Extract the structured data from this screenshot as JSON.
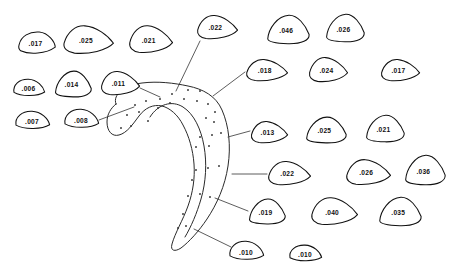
{
  "figure": {
    "title": "",
    "background_color": "#ffffff",
    "ink_color": "#111111",
    "main_shape_name": "hook-shaped-outline",
    "dot_count": 34
  },
  "blobs": [
    {
      "id": "blob-017-a",
      "label": ".017",
      "x": 18,
      "y": 30,
      "w": 38,
      "h": 26,
      "shape": "wedge-left",
      "leader": false
    },
    {
      "id": "blob-025-a",
      "label": ".025",
      "x": 62,
      "y": 24,
      "w": 52,
      "h": 31,
      "shape": "wedge-wide",
      "leader": false
    },
    {
      "id": "blob-021-a",
      "label": ".021",
      "x": 128,
      "y": 24,
      "w": 45,
      "h": 30,
      "shape": "wedge-wide",
      "leader": false
    },
    {
      "id": "blob-022-a",
      "label": ".022",
      "x": 196,
      "y": 14,
      "w": 42,
      "h": 26,
      "shape": "wedge-wide",
      "leader": true
    },
    {
      "id": "blob-046",
      "label": ".046",
      "x": 266,
      "y": 14,
      "w": 44,
      "h": 31,
      "shape": "triangle-round",
      "leader": false
    },
    {
      "id": "blob-026-a",
      "label": ".026",
      "x": 325,
      "y": 13,
      "w": 40,
      "h": 30,
      "shape": "triangle-round",
      "leader": false
    },
    {
      "id": "blob-006",
      "label": ".006",
      "x": 12,
      "y": 78,
      "w": 33,
      "h": 20,
      "shape": "small-oval",
      "leader": false
    },
    {
      "id": "blob-014",
      "label": ".014",
      "x": 54,
      "y": 70,
      "w": 38,
      "h": 28,
      "shape": "triangle-round",
      "leader": false
    },
    {
      "id": "blob-011",
      "label": ".011",
      "x": 100,
      "y": 70,
      "w": 40,
      "h": 26,
      "shape": "wedge-wide",
      "leader": true
    },
    {
      "id": "blob-018",
      "label": ".018",
      "x": 245,
      "y": 58,
      "w": 43,
      "h": 24,
      "shape": "wedge-wide",
      "leader": true
    },
    {
      "id": "blob-024",
      "label": ".024",
      "x": 308,
      "y": 56,
      "w": 40,
      "h": 27,
      "shape": "wedge-wide",
      "leader": false
    },
    {
      "id": "blob-017-b",
      "label": ".017",
      "x": 380,
      "y": 58,
      "w": 40,
      "h": 24,
      "shape": "wedge-wide",
      "leader": false
    },
    {
      "id": "blob-007",
      "label": ".007",
      "x": 14,
      "y": 110,
      "w": 36,
      "h": 21,
      "shape": "small-oval",
      "leader": false
    },
    {
      "id": "blob-008",
      "label": ".008",
      "x": 63,
      "y": 108,
      "w": 36,
      "h": 22,
      "shape": "small-oval",
      "leader": true
    },
    {
      "id": "blob-013",
      "label": ".013",
      "x": 250,
      "y": 120,
      "w": 38,
      "h": 24,
      "shape": "wedge-wide",
      "leader": true
    },
    {
      "id": "blob-025-b",
      "label": ".025",
      "x": 305,
      "y": 116,
      "w": 42,
      "h": 28,
      "shape": "triangle-round",
      "leader": false
    },
    {
      "id": "blob-021-b",
      "label": ".021",
      "x": 365,
      "y": 114,
      "w": 40,
      "h": 29,
      "shape": "triangle-round",
      "leader": false
    },
    {
      "id": "blob-022-b",
      "label": ".022",
      "x": 267,
      "y": 160,
      "w": 44,
      "h": 26,
      "shape": "wedge-wide",
      "leader": true
    },
    {
      "id": "blob-026-b",
      "label": ".026",
      "x": 345,
      "y": 158,
      "w": 46,
      "h": 28,
      "shape": "wedge-wide",
      "leader": false
    },
    {
      "id": "blob-036",
      "label": ".036",
      "x": 404,
      "y": 154,
      "w": 42,
      "h": 32,
      "shape": "triangle-round",
      "leader": false
    },
    {
      "id": "blob-019",
      "label": ".019",
      "x": 248,
      "y": 198,
      "w": 38,
      "h": 27,
      "shape": "triangle-round",
      "leader": true
    },
    {
      "id": "blob-040",
      "label": ".040",
      "x": 310,
      "y": 196,
      "w": 48,
      "h": 30,
      "shape": "wedge-wide",
      "leader": false
    },
    {
      "id": "blob-035",
      "label": ".035",
      "x": 378,
      "y": 196,
      "w": 44,
      "h": 31,
      "shape": "triangle-round",
      "leader": false
    },
    {
      "id": "blob-010-a",
      "label": ".010",
      "x": 228,
      "y": 240,
      "w": 36,
      "h": 22,
      "shape": "small-oval",
      "leader": true
    },
    {
      "id": "blob-010-b",
      "label": ".010",
      "x": 288,
      "y": 244,
      "w": 34,
      "h": 19,
      "shape": "small-oval",
      "leader": false
    }
  ],
  "leader_lines": [
    {
      "id": "leader-022-a",
      "from_blob": "blob-022-a",
      "x1": 200,
      "y1": 41,
      "x2": 176,
      "y2": 91
    },
    {
      "id": "leader-011",
      "from_blob": "blob-011",
      "x1": 140,
      "y1": 88,
      "x2": 160,
      "y2": 97
    },
    {
      "id": "leader-018",
      "from_blob": "blob-018",
      "x1": 245,
      "y1": 72,
      "x2": 213,
      "y2": 96
    },
    {
      "id": "leader-008",
      "from_blob": "blob-008",
      "x1": 99,
      "y1": 120,
      "x2": 134,
      "y2": 107
    },
    {
      "id": "leader-013",
      "from_blob": "blob-013",
      "x1": 250,
      "y1": 131,
      "x2": 228,
      "y2": 137
    },
    {
      "id": "leader-022-b",
      "from_blob": "blob-022-b",
      "x1": 267,
      "y1": 174,
      "x2": 232,
      "y2": 174
    },
    {
      "id": "leader-019",
      "from_blob": "blob-019",
      "x1": 248,
      "y1": 211,
      "x2": 215,
      "y2": 198
    },
    {
      "id": "leader-010-a",
      "from_blob": "blob-010-a",
      "x1": 231,
      "y1": 247,
      "x2": 194,
      "y2": 229
    }
  ],
  "dots": [
    {
      "x": 160,
      "y": 99
    },
    {
      "x": 172,
      "y": 94
    },
    {
      "x": 188,
      "y": 90
    },
    {
      "x": 200,
      "y": 91
    },
    {
      "x": 158,
      "y": 108
    },
    {
      "x": 170,
      "y": 103
    },
    {
      "x": 184,
      "y": 99
    },
    {
      "x": 197,
      "y": 101
    },
    {
      "x": 135,
      "y": 105
    },
    {
      "x": 146,
      "y": 101
    },
    {
      "x": 127,
      "y": 115
    },
    {
      "x": 139,
      "y": 112
    },
    {
      "x": 121,
      "y": 128
    },
    {
      "x": 131,
      "y": 126
    },
    {
      "x": 148,
      "y": 121
    },
    {
      "x": 208,
      "y": 104
    },
    {
      "x": 215,
      "y": 112
    },
    {
      "x": 206,
      "y": 118
    },
    {
      "x": 200,
      "y": 137
    },
    {
      "x": 212,
      "y": 135
    },
    {
      "x": 221,
      "y": 133
    },
    {
      "x": 196,
      "y": 147
    },
    {
      "x": 209,
      "y": 146
    },
    {
      "x": 196,
      "y": 170
    },
    {
      "x": 208,
      "y": 168
    },
    {
      "x": 219,
      "y": 166
    },
    {
      "x": 192,
      "y": 180
    },
    {
      "x": 188,
      "y": 196
    },
    {
      "x": 200,
      "y": 194
    },
    {
      "x": 210,
      "y": 197
    },
    {
      "x": 183,
      "y": 214
    },
    {
      "x": 178,
      "y": 228
    },
    {
      "x": 186,
      "y": 226
    },
    {
      "x": 214,
      "y": 122
    }
  ]
}
